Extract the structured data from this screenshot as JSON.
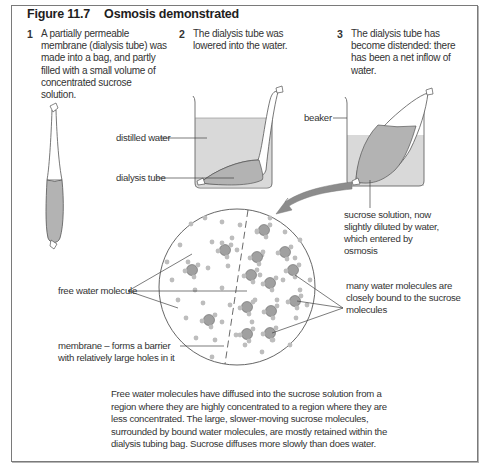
{
  "figure": {
    "number": "Figure 11.7",
    "title": "Osmosis demonstrated"
  },
  "steps": [
    {
      "number": "1",
      "text": "A partially permeable membrane (dialysis tube) was made into a bag, and partly filled with a small volume of concentrated sucrose solution."
    },
    {
      "number": "2",
      "text": "The dialysis tube was lowered into the water."
    },
    {
      "number": "3",
      "text": "The dialysis tube has become distended: there has been a net inflow of water."
    }
  ],
  "labels": {
    "distilled_water": "distilled water",
    "dialysis_tube": "dialysis tube",
    "beaker": "beaker",
    "sucrose_solution": "sucrose solution, now slightly diluted by water, which entered by osmosis",
    "free_water_molecule": "free water molecule",
    "membrane": "membrane – forms a barrier with relatively large holes in it",
    "bound_water": "many water molecules are closely bound to the sucrose molecules"
  },
  "caption": "Free water molecules have diffused into the sucrose solution from a region where they are highly concentrated to a region where they are less concentrated. The large, slower-moving sucrose molecules, surrounded by bound water molecules, are mostly retained within the dialysis tubing bag. Sucrose diffuses more slowly than does water.",
  "colors": {
    "border": "#7a7a7a",
    "water_fill": "#d9d9d9",
    "solution_fill": "#b3b3b3",
    "molecule_small": "#bdbdbd",
    "molecule_large": "#a0a0a0",
    "arrow": "#8c8c8c"
  }
}
